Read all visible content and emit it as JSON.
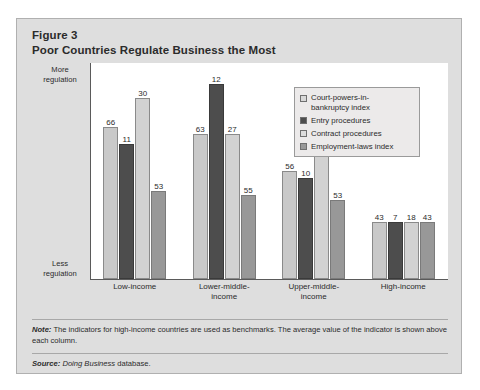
{
  "figure": {
    "label": "Figure 3",
    "title": "Poor Countries Regulate Business the Most"
  },
  "axis": {
    "top_caption": "More\nregulation",
    "top_caption_line1": "More",
    "top_caption_line2": "regulation",
    "bottom_caption_line1": "Less",
    "bottom_caption_line2": "regulation"
  },
  "footer": {
    "note_lead": "Note:",
    "note_text": " The indicators for high-income countries are used as benchmarks. The average value of the indicator is shown above each column.",
    "source_lead": "Source:",
    "source_italic": " Doing Business",
    "source_rest": " database."
  },
  "colors": {
    "panel_bg": "#dedede",
    "panel_border": "#b0b0b0",
    "plot_bg": "#ffffff",
    "axis": "#5a5a5a",
    "series_0": "#c9c9c9",
    "series_1": "#4d4d4d",
    "series_2": "#d2d2d2",
    "series_3": "#989898",
    "text": "#2b2b2b"
  },
  "chart_data": {
    "type": "bar",
    "title": "Poor Countries Regulate Business the Most",
    "subtitle": "Figure 3",
    "xlabel": "",
    "ylabel": "More regulation / Less regulation",
    "grid": false,
    "legend_position": "top-right",
    "axis_tick_labels": [],
    "note": "The indicators for high-income countries are used as benchmarks. The average value of the indicator is shown above each column.",
    "source": "Doing Business database.",
    "categories": [
      "Low-income",
      "Lower-middle-income",
      "Upper-middle-income",
      "High-income"
    ],
    "category_label_lines": [
      [
        "Low-income"
      ],
      [
        "Lower-middle-",
        "income"
      ],
      [
        "Upper-middle-",
        "income"
      ],
      [
        "High-income"
      ]
    ],
    "series": [
      {
        "name": "Court-powers-in-bankruptcy index",
        "legend_lines": [
          "Court-powers-in-",
          "bankruptcy index"
        ],
        "color": "#c9c9c9",
        "values": [
          66,
          63,
          56,
          43
        ],
        "bar_pixel_heights": [
          152,
          145,
          108,
          57
        ]
      },
      {
        "name": "Entry procedures",
        "legend_lines": [
          "Entry procedures"
        ],
        "color": "#4d4d4d",
        "values": [
          11,
          12,
          10,
          7
        ],
        "bar_pixel_heights": [
          135,
          195,
          101,
          57
        ]
      },
      {
        "name": "Contract procedures",
        "legend_lines": [
          "Contract procedures"
        ],
        "color": "#d2d2d2",
        "values": [
          30,
          27,
          27,
          18
        ],
        "bar_pixel_heights": [
          181,
          145,
          149,
          57
        ]
      },
      {
        "name": "Employment-laws index",
        "legend_lines": [
          "Employment-laws index"
        ],
        "color": "#989898",
        "values": [
          53,
          55,
          53,
          43
        ],
        "bar_pixel_heights": [
          88,
          84,
          79,
          57
        ]
      }
    ]
  }
}
